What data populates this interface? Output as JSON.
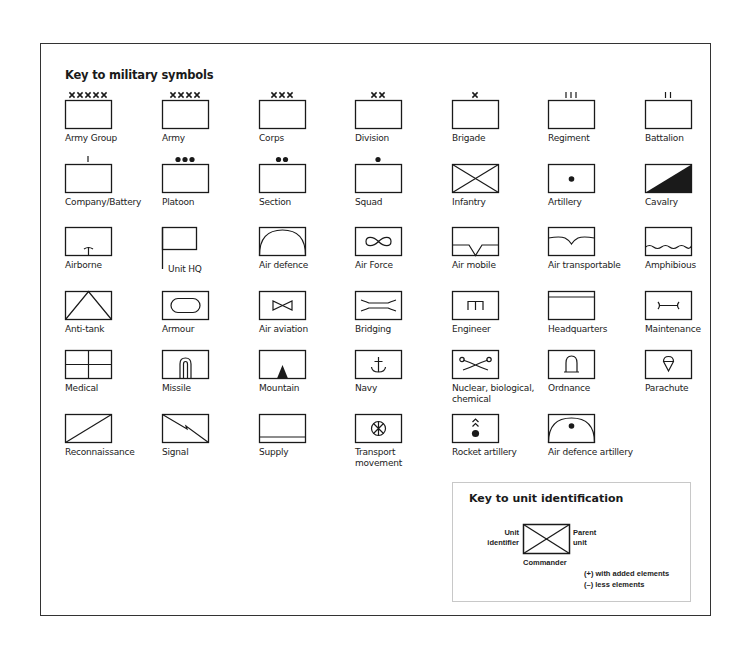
{
  "title": "Key to military symbols",
  "colors": {
    "stroke": "#1a1a1a",
    "border": "#333333",
    "panel_border": "#c8c8c8"
  },
  "symbols": [
    {
      "label": "Army Group",
      "icon": "army-group",
      "col": 0,
      "row": 0
    },
    {
      "label": "Army",
      "icon": "army",
      "col": 1,
      "row": 0
    },
    {
      "label": "Corps",
      "icon": "corps",
      "col": 2,
      "row": 0
    },
    {
      "label": "Division",
      "icon": "division",
      "col": 3,
      "row": 0
    },
    {
      "label": "Brigade",
      "icon": "brigade",
      "col": 4,
      "row": 0
    },
    {
      "label": "Regiment",
      "icon": "regiment",
      "col": 5,
      "row": 0
    },
    {
      "label": "Battalion",
      "icon": "battalion",
      "col": 6,
      "row": 0
    },
    {
      "label": "Company/Battery",
      "icon": "company",
      "col": 0,
      "row": 1
    },
    {
      "label": "Platoon",
      "icon": "platoon",
      "col": 1,
      "row": 1
    },
    {
      "label": "Section",
      "icon": "section",
      "col": 2,
      "row": 1
    },
    {
      "label": "Squad",
      "icon": "squad",
      "col": 3,
      "row": 1
    },
    {
      "label": "Infantry",
      "icon": "infantry",
      "col": 4,
      "row": 1
    },
    {
      "label": "Artillery",
      "icon": "artillery",
      "col": 5,
      "row": 1
    },
    {
      "label": "Cavalry",
      "icon": "cavalry",
      "col": 6,
      "row": 1
    },
    {
      "label": "Airborne",
      "icon": "airborne",
      "col": 0,
      "row": 2
    },
    {
      "label": "Unit HQ",
      "icon": "unit-hq",
      "col": 1,
      "row": 2
    },
    {
      "label": "Air defence",
      "icon": "air-defence",
      "col": 2,
      "row": 2
    },
    {
      "label": "Air Force",
      "icon": "air-force",
      "col": 3,
      "row": 2
    },
    {
      "label": "Air mobile",
      "icon": "air-mobile",
      "col": 4,
      "row": 2
    },
    {
      "label": "Air transportable",
      "icon": "air-transportable",
      "col": 5,
      "row": 2
    },
    {
      "label": "Amphibious",
      "icon": "amphibious",
      "col": 6,
      "row": 2
    },
    {
      "label": "Anti-tank",
      "icon": "anti-tank",
      "col": 0,
      "row": 3
    },
    {
      "label": "Armour",
      "icon": "armour",
      "col": 1,
      "row": 3
    },
    {
      "label": "Air aviation",
      "icon": "air-aviation",
      "col": 2,
      "row": 3
    },
    {
      "label": "Bridging",
      "icon": "bridging",
      "col": 3,
      "row": 3
    },
    {
      "label": "Engineer",
      "icon": "engineer",
      "col": 4,
      "row": 3
    },
    {
      "label": "Headquarters",
      "icon": "headquarters",
      "col": 5,
      "row": 3
    },
    {
      "label": "Maintenance",
      "icon": "maintenance",
      "col": 6,
      "row": 3
    },
    {
      "label": "Medical",
      "icon": "medical",
      "col": 0,
      "row": 4
    },
    {
      "label": "Missile",
      "icon": "missile",
      "col": 1,
      "row": 4
    },
    {
      "label": "Mountain",
      "icon": "mountain",
      "col": 2,
      "row": 4
    },
    {
      "label": "Navy",
      "icon": "navy",
      "col": 3,
      "row": 4
    },
    {
      "label": "Nuclear, biological,\nchemical",
      "icon": "nbc",
      "col": 4,
      "row": 4
    },
    {
      "label": "Ordnance",
      "icon": "ordnance",
      "col": 5,
      "row": 4
    },
    {
      "label": "Parachute",
      "icon": "parachute",
      "col": 6,
      "row": 4
    },
    {
      "label": "Reconnaissance",
      "icon": "reconnaissance",
      "col": 0,
      "row": 5
    },
    {
      "label": "Signal",
      "icon": "signal",
      "col": 1,
      "row": 5
    },
    {
      "label": "Supply",
      "icon": "supply",
      "col": 2,
      "row": 5
    },
    {
      "label": "Transport\nmovement",
      "icon": "transport-movement",
      "col": 3,
      "row": 5
    },
    {
      "label": "Rocket artillery",
      "icon": "rocket-artillery",
      "col": 4,
      "row": 5
    },
    {
      "label": "Air defence artillery",
      "icon": "air-defence-artillery",
      "col": 5,
      "row": 5
    }
  ],
  "unit_identification": {
    "title": "Key to unit identification",
    "unit_identifier": "Unit\nidentifier",
    "parent_unit": "Parent\nunit",
    "commander": "Commander",
    "added": "(+) with added elements",
    "less": "(–) less elements"
  }
}
